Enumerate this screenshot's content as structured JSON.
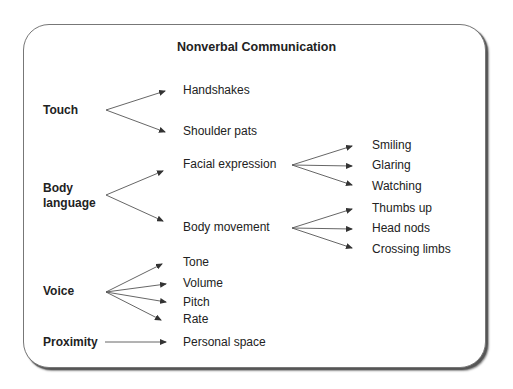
{
  "title": "Nonverbal Communication",
  "categories": [
    {
      "label": "Touch",
      "items": [
        {
          "label": "Handshakes"
        },
        {
          "label": "Shoulder pats"
        }
      ]
    },
    {
      "label": "Body language",
      "label_lines": [
        "Body",
        "language"
      ],
      "items": [
        {
          "label": "Facial expression",
          "subitems": [
            "Smiling",
            "Glaring",
            "Watching"
          ]
        },
        {
          "label": "Body movement",
          "subitems": [
            "Thumbs up",
            "Head nods",
            "Crossing limbs"
          ]
        }
      ]
    },
    {
      "label": "Voice",
      "items": [
        {
          "label": "Tone"
        },
        {
          "label": "Volume"
        },
        {
          "label": "Pitch"
        },
        {
          "label": "Rate"
        }
      ]
    },
    {
      "label": "Proximity",
      "items": [
        {
          "label": "Personal space"
        }
      ]
    }
  ],
  "colors": {
    "text": "#222222",
    "arrow": "#555555",
    "border": "#777777",
    "background": "#ffffff"
  }
}
